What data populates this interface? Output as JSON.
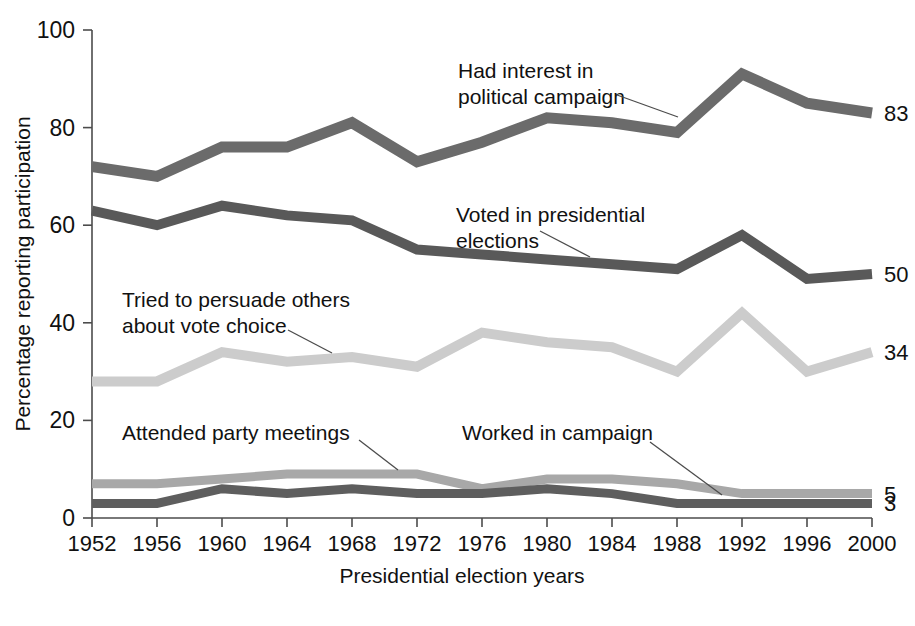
{
  "chart_data": {
    "type": "line",
    "title": "",
    "xlabel": "Presidential election years",
    "ylabel": "Percentage reporting participation",
    "categories": [
      "1952",
      "1956",
      "1960",
      "1964",
      "1968",
      "1972",
      "1976",
      "1980",
      "1984",
      "1988",
      "1992",
      "1996",
      "2000"
    ],
    "x": [
      1952,
      1956,
      1960,
      1964,
      1968,
      1972,
      1976,
      1980,
      1984,
      1988,
      1992,
      1996,
      2000
    ],
    "xlim": [
      1952,
      2000
    ],
    "ylim": [
      0,
      100
    ],
    "yticks": [
      0,
      20,
      40,
      60,
      80,
      100
    ],
    "ytick_labels": [
      "0",
      "20",
      "40",
      "60",
      "80",
      "100"
    ],
    "grid": false,
    "legend": "inline-annotations",
    "series": [
      {
        "name": "Had interest in political campaign",
        "color": "#6b6b6b",
        "end_label": "83",
        "values": [
          72,
          70,
          76,
          76,
          81,
          73,
          77,
          82,
          81,
          79,
          91,
          85,
          83
        ]
      },
      {
        "name": "Voted in presidential elections",
        "color": "#595959",
        "end_label": "50",
        "values": [
          63,
          60,
          64,
          62,
          61,
          55,
          54,
          53,
          52,
          51,
          58,
          49,
          50
        ]
      },
      {
        "name": "Tried to persuade others about vote choice",
        "color": "#cccccc",
        "end_label": "34",
        "values": [
          28,
          28,
          34,
          32,
          33,
          31,
          38,
          36,
          35,
          30,
          42,
          30,
          34
        ]
      },
      {
        "name": "Attended party meetings",
        "color": "#a8a8a8",
        "end_label": "5",
        "values": [
          7,
          7,
          8,
          9,
          9,
          9,
          6,
          8,
          8,
          7,
          5,
          5,
          5
        ]
      },
      {
        "name": "Worked in campaign",
        "color": "#5e5e5e",
        "end_label": "3",
        "values": [
          3,
          3,
          6,
          5,
          6,
          5,
          5,
          6,
          5,
          3,
          3,
          3,
          3
        ]
      }
    ],
    "annotations": [
      {
        "id": "interest",
        "lines": [
          "Had interest in",
          "political campaign"
        ],
        "text": "Had interest in political campaign",
        "text_x": 458,
        "text_y": 78,
        "leader": "M 617 95 L 678 117"
      },
      {
        "id": "voted",
        "lines": [
          "Voted in presidential",
          "elections"
        ],
        "text": "Voted in presidential elections",
        "text_x": 456,
        "text_y": 222,
        "leader": "M 540 231 L 590 257"
      },
      {
        "id": "persuade",
        "lines": [
          "Tried to persuade others",
          "about vote choice"
        ],
        "text": "Tried to persuade others about vote choice",
        "text_x": 122,
        "text_y": 307,
        "leader": "M 288 330 L 332 353"
      },
      {
        "id": "attended",
        "lines": [
          "Attended party meetings"
        ],
        "text": "Attended party meetings",
        "text_x": 122,
        "text_y": 440,
        "leader": "M 359 440 L 398 470"
      },
      {
        "id": "worked",
        "lines": [
          "Worked in campaign"
        ],
        "text": "Worked in campaign",
        "text_x": 462,
        "text_y": 440,
        "leader": "M 650 442 L 722 495"
      }
    ]
  },
  "colors": {
    "background": "#ffffff",
    "axis": "#4c4c4c",
    "text": "#111111"
  }
}
